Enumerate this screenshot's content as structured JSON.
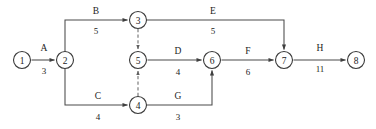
{
  "diagram": {
    "type": "activity-on-arrow-network",
    "title": "",
    "canvas": {
      "width": 376,
      "height": 129,
      "background": "#ffffff"
    },
    "colors": {
      "node_stroke": "#3a3a3a",
      "edge_stroke": "#4a4a4a",
      "dummy_stroke": "#6a6a6a",
      "text": "#1c1c1c",
      "background": "#ffffff"
    },
    "nodes": [
      {
        "id": "n1",
        "label": "1",
        "cx": 22,
        "cy": 60,
        "r": 8.5
      },
      {
        "id": "n2",
        "label": "2",
        "cx": 65,
        "cy": 60,
        "r": 8.5
      },
      {
        "id": "n3",
        "label": "3",
        "cx": 138,
        "cy": 20,
        "r": 8.5
      },
      {
        "id": "n4",
        "label": "4",
        "cx": 138,
        "cy": 105,
        "r": 8.5
      },
      {
        "id": "n5",
        "label": "5",
        "cx": 138,
        "cy": 60,
        "r": 8.5
      },
      {
        "id": "n6",
        "label": "6",
        "cx": 212,
        "cy": 60,
        "r": 8.5
      },
      {
        "id": "n7",
        "label": "7",
        "cx": 284,
        "cy": 60,
        "r": 8.5
      },
      {
        "id": "n8",
        "label": "8",
        "cx": 356,
        "cy": 60,
        "r": 8.5
      }
    ],
    "edges": [
      {
        "id": "edge-a",
        "name": "A",
        "duration": "3",
        "from": "n1",
        "to": "n2",
        "style": "solid",
        "path": "M 31.5 60 L 54.5 60",
        "name_pos": {
          "x": 44,
          "y": 48
        },
        "dur_pos": {
          "x": 44,
          "y": 71
        }
      },
      {
        "id": "edge-b",
        "name": "B",
        "duration": "5",
        "from": "n2",
        "to": "n3",
        "style": "solid",
        "path": "M 65 51.5 L 65 20 L 127.5 20",
        "name_pos": {
          "x": 96,
          "y": 11
        },
        "dur_pos": {
          "x": 96,
          "y": 31
        }
      },
      {
        "id": "edge-c",
        "name": "C",
        "duration": "4",
        "from": "n2",
        "to": "n4",
        "style": "solid",
        "path": "M 65 68.5 L 65 105 L 127.5 105",
        "name_pos": {
          "x": 98,
          "y": 96
        },
        "dur_pos": {
          "x": 98,
          "y": 117
        }
      },
      {
        "id": "edge-d",
        "name": "D",
        "duration": "4",
        "from": "n5",
        "to": "n6",
        "style": "solid",
        "path": "M 147.5 60 L 201.5 60",
        "name_pos": {
          "x": 178,
          "y": 51
        },
        "dur_pos": {
          "x": 178,
          "y": 72
        }
      },
      {
        "id": "edge-e",
        "name": "E",
        "duration": "5",
        "from": "n3",
        "to": "n7",
        "style": "solid",
        "path": "M 147 20 L 284 20 L 284 49.5",
        "name_pos": {
          "x": 213,
          "y": 11
        },
        "dur_pos": {
          "x": 213,
          "y": 31
        }
      },
      {
        "id": "edge-f",
        "name": "F",
        "duration": "6",
        "from": "n6",
        "to": "n7",
        "style": "solid",
        "path": "M 221.5 60 L 273.5 60",
        "name_pos": {
          "x": 248,
          "y": 51
        },
        "dur_pos": {
          "x": 248,
          "y": 72
        }
      },
      {
        "id": "edge-g",
        "name": "G",
        "duration": "3",
        "from": "n4",
        "to": "n6",
        "style": "solid",
        "path": "M 147 105 L 212 105 L 212 70.5",
        "name_pos": {
          "x": 178,
          "y": 96
        },
        "dur_pos": {
          "x": 178,
          "y": 117
        }
      },
      {
        "id": "edge-h",
        "name": "H",
        "duration": "11",
        "from": "n7",
        "to": "n8",
        "style": "solid",
        "path": "M 293.5 60 L 345.5 60",
        "name_pos": {
          "x": 320,
          "y": 48
        },
        "dur_pos": {
          "x": 320,
          "y": 69
        }
      },
      {
        "id": "edge-dummy-3-5",
        "name": "",
        "duration": "",
        "from": "n3",
        "to": "n5",
        "style": "dashed",
        "path": "M 138 29 L 138 49",
        "name_pos": null,
        "dur_pos": null
      },
      {
        "id": "edge-dummy-4-5",
        "name": "",
        "duration": "",
        "from": "n4",
        "to": "n5",
        "style": "dashed",
        "path": "M 138 96 L 138 71",
        "name_pos": null,
        "dur_pos": null
      }
    ]
  }
}
